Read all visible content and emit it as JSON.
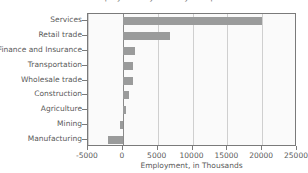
{
  "chart_data": {
    "type": "bar",
    "orientation": "horizontal",
    "title": "Employment by Industry Group",
    "xlabel": "Employment, in Thousands",
    "ylabel": "",
    "categories": [
      "Services",
      "Retail trade",
      "Finance and Insurance",
      "Transportation",
      "Wholesale trade",
      "Construction",
      "Agriculture",
      "Mining",
      "Manufacturing"
    ],
    "values": [
      20000,
      6700,
      1800,
      1400,
      1400,
      850,
      450,
      -400,
      -2200
    ],
    "xlim": [
      -5000,
      25000
    ],
    "xticks": [
      -5000,
      0,
      5000,
      10000,
      15000,
      20000,
      25000
    ],
    "xticklabels": [
      "-5000",
      "0",
      "5000",
      "10000",
      "15000",
      "20000",
      "25000"
    ],
    "grid": "vertical",
    "legend": "none",
    "bar_color": "#9a9b9b",
    "plot_background": "#fafafa",
    "frame_color": "#7a7a7a",
    "gridline_color": "#cfcfcf"
  }
}
